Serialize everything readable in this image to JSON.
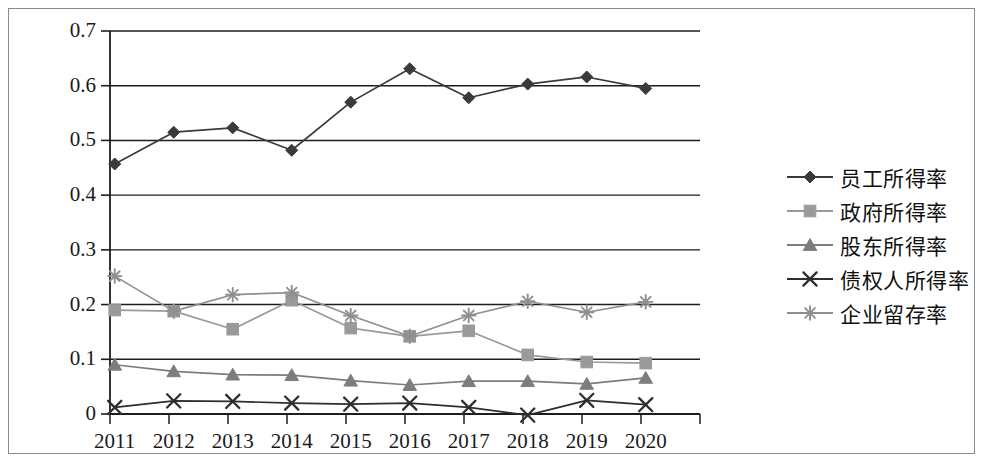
{
  "chart_data": {
    "type": "line",
    "title": "",
    "xlabel": "",
    "ylabel": "",
    "categories": [
      "2011",
      "2012",
      "2013",
      "2014",
      "2015",
      "2016",
      "2017",
      "2018",
      "2019",
      "2020"
    ],
    "ylim": [
      0,
      0.7
    ],
    "yticks": [
      "0",
      "0.1",
      "0.2",
      "0.3",
      "0.4",
      "0.5",
      "0.6",
      "0.7"
    ],
    "ytick_values": [
      0,
      0.1,
      0.2,
      0.3,
      0.4,
      0.5,
      0.6,
      0.7
    ],
    "grid": true,
    "legend_position": "right",
    "series": [
      {
        "name": "员工所得率",
        "marker": "diamond",
        "color": "#3a3a3a",
        "values": [
          0.457,
          0.515,
          0.523,
          0.482,
          0.57,
          0.631,
          0.578,
          0.603,
          0.616,
          0.595
        ]
      },
      {
        "name": "政府所得率",
        "marker": "square",
        "color": "#9a9a9a",
        "values": [
          0.19,
          0.188,
          0.155,
          0.208,
          0.157,
          0.142,
          0.152,
          0.108,
          0.095,
          0.093
        ]
      },
      {
        "name": "股东所得率",
        "marker": "triangle",
        "color": "#7d7d7d",
        "values": [
          0.09,
          0.078,
          0.072,
          0.071,
          0.061,
          0.053,
          0.06,
          0.06,
          0.055,
          0.066
        ]
      },
      {
        "name": "债权人所得率",
        "marker": "x",
        "color": "#2e2e2e",
        "values": [
          0.012,
          0.024,
          0.023,
          0.02,
          0.018,
          0.02,
          0.012,
          -0.002,
          0.025,
          0.017
        ]
      },
      {
        "name": "企业留存率",
        "marker": "asterisk",
        "color": "#8f8f8f",
        "values": [
          0.252,
          0.188,
          0.218,
          0.222,
          0.18,
          0.142,
          0.18,
          0.206,
          0.186,
          0.205
        ]
      }
    ]
  },
  "legend": {
    "items": [
      {
        "label": "员工所得率"
      },
      {
        "label": "政府所得率"
      },
      {
        "label": "股东所得率"
      },
      {
        "label": "债权人所得率"
      },
      {
        "label": "企业留存率"
      }
    ]
  }
}
